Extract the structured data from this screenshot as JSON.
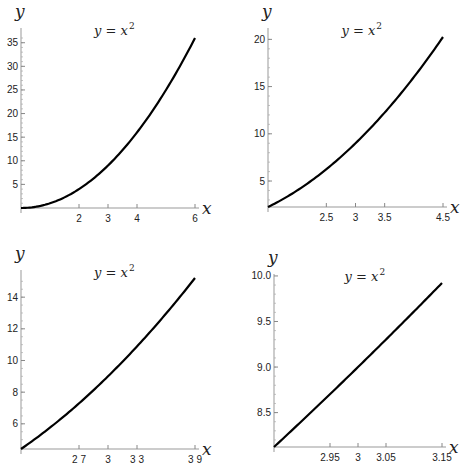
{
  "chart_data": [
    {
      "type": "line",
      "title": "y = x^2",
      "xlabel": "x",
      "ylabel": "y",
      "xlim": [
        0,
        6
      ],
      "ylim": [
        0,
        36
      ],
      "x_ticks": [
        {
          "v": 2,
          "label": "2"
        },
        {
          "v": 3,
          "label": "3"
        },
        {
          "v": 4,
          "label": "4"
        },
        {
          "v": 6,
          "label": "6"
        }
      ],
      "y_ticks": [
        {
          "v": 5,
          "label": "5"
        },
        {
          "v": 10,
          "label": "10"
        },
        {
          "v": 15,
          "label": "15"
        },
        {
          "v": 20,
          "label": "20"
        },
        {
          "v": 25,
          "label": "25"
        },
        {
          "v": 30,
          "label": "30"
        },
        {
          "v": 35,
          "label": "35"
        }
      ],
      "y_minor_step": 1,
      "series": [
        {
          "name": "y = x^2",
          "x": [
            0,
            1,
            2,
            3,
            4,
            5,
            6
          ],
          "y": [
            0,
            1,
            4,
            9,
            16,
            25,
            36
          ]
        }
      ],
      "grid": false,
      "layout": {
        "left": 0,
        "top": 0,
        "x0px": 21,
        "x1px": 195,
        "y0px": 208,
        "y1px": 38,
        "axisTop": 28,
        "axisRight": 195
      }
    },
    {
      "type": "line",
      "title": "y = x^2",
      "xlabel": "x",
      "ylabel": "y",
      "xlim": [
        1.5,
        4.5
      ],
      "ylim": [
        2.25,
        20.25
      ],
      "x_ticks": [
        {
          "v": 2.5,
          "label": "2.5"
        },
        {
          "v": 3,
          "label": "3"
        },
        {
          "v": 3.5,
          "label": "3.5"
        },
        {
          "v": 4.5,
          "label": "4.5"
        }
      ],
      "y_ticks": [
        {
          "v": 5,
          "label": "5"
        },
        {
          "v": 10,
          "label": "10"
        },
        {
          "v": 15,
          "label": "15"
        },
        {
          "v": 20,
          "label": "20"
        }
      ],
      "y_minor_step": 1,
      "series": [
        {
          "name": "y = x^2",
          "x": [
            1.5,
            2,
            2.5,
            3,
            3.5,
            4,
            4.5
          ],
          "y": [
            2.25,
            4,
            6.25,
            9,
            12.25,
            16,
            20.25
          ]
        }
      ],
      "grid": false,
      "layout": {
        "left": 233,
        "top": 0,
        "x0px": 35,
        "x1px": 210,
        "y0px": 207,
        "y1px": 37,
        "axisTop": 28,
        "axisRight": 210
      }
    },
    {
      "type": "line",
      "title": "y = x^2",
      "xlabel": "x",
      "ylabel": "y",
      "xlim": [
        2.1,
        3.9
      ],
      "ylim": [
        4.41,
        15.21
      ],
      "x_ticks": [
        {
          "v": 2.7,
          "label": "2 7"
        },
        {
          "v": 3,
          "label": "3"
        },
        {
          "v": 3.3,
          "label": "3 3"
        },
        {
          "v": 3.9,
          "label": "3 9"
        }
      ],
      "y_ticks": [
        {
          "v": 6,
          "label": "6"
        },
        {
          "v": 8,
          "label": "8"
        },
        {
          "v": 10,
          "label": "10"
        },
        {
          "v": 12,
          "label": "12"
        },
        {
          "v": 14,
          "label": "14"
        }
      ],
      "y_minor_step": 0.5,
      "series": [
        {
          "name": "y = x^2",
          "x": [
            2.1,
            2.4,
            2.7,
            3,
            3.3,
            3.6,
            3.9
          ],
          "y": [
            4.41,
            5.76,
            7.29,
            9,
            10.89,
            12.96,
            15.21
          ]
        }
      ],
      "grid": false,
      "layout": {
        "left": 0,
        "top": 237,
        "x0px": 21,
        "x1px": 195,
        "y0px": 212,
        "y1px": 41,
        "axisTop": 33,
        "axisRight": 195
      }
    },
    {
      "type": "line",
      "title": "y = x^2",
      "xlabel": "x",
      "ylabel": "y",
      "xlim": [
        2.85,
        3.15
      ],
      "ylim": [
        8.1225,
        9.9225
      ],
      "x_ticks": [
        {
          "v": 2.95,
          "label": "2.95"
        },
        {
          "v": 3,
          "label": "3"
        },
        {
          "v": 3.05,
          "label": "3.05"
        },
        {
          "v": 3.15,
          "label": "3.15"
        }
      ],
      "y_ticks": [
        {
          "v": 8.5,
          "label": "8.5"
        },
        {
          "v": 9.0,
          "label": "9.0"
        },
        {
          "v": 9.5,
          "label": "9.5"
        },
        {
          "v": 10.0,
          "label": "10.0"
        }
      ],
      "y_minor_step": 0.1,
      "series": [
        {
          "name": "y = x^2",
          "x": [
            2.85,
            2.95,
            3,
            3.05,
            3.15
          ],
          "y": [
            8.1225,
            8.7025,
            9,
            9.3025,
            9.9225
          ]
        }
      ],
      "grid": false,
      "layout": {
        "left": 233,
        "top": 237,
        "x0px": 41,
        "x1px": 209,
        "y0px": 210,
        "y1px": 46,
        "axisTop": 37,
        "axisRight": 209
      }
    }
  ],
  "labels": {
    "x_axis": "x",
    "y_axis": "y",
    "title_base": "y = x",
    "title_exp": "2"
  }
}
